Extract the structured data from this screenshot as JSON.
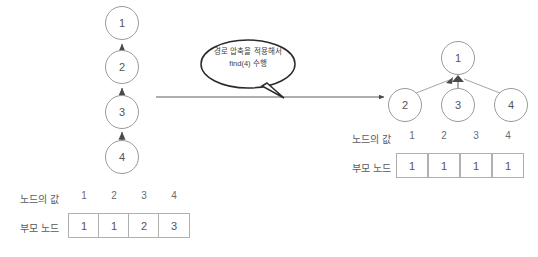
{
  "diagram": {
    "callout": {
      "line1": "경로 압축을 적용해서",
      "line2": "find(4) 수행"
    },
    "left": {
      "chain_nodes": [
        "1",
        "2",
        "3",
        "4"
      ],
      "table": {
        "row1_label": "노드의 값",
        "row2_label": "부모 노드",
        "columns": [
          "1",
          "2",
          "3",
          "4"
        ],
        "parents": [
          "1",
          "1",
          "2",
          "3"
        ]
      }
    },
    "right": {
      "root_node": "1",
      "child_nodes": [
        "2",
        "3",
        "4"
      ],
      "table": {
        "row1_label": "노드의 값",
        "row2_label": "부모 노드",
        "columns": [
          "1",
          "2",
          "3",
          "4"
        ],
        "parents": [
          "1",
          "1",
          "1",
          "1"
        ]
      }
    },
    "colors": {
      "node_stroke": "#9a9a9a",
      "cell_stroke": "#b0b0b0",
      "text": "#555555",
      "arrow": "#4a4a4a",
      "bubble_stroke": "#2b2b2b",
      "background": "#ffffff"
    }
  }
}
